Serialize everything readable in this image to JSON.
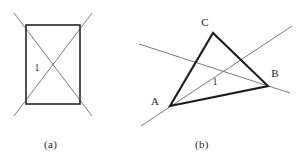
{
  "page": {
    "width": 304,
    "height": 168,
    "background": "#ffffff",
    "ink_color": "#2b2b2b",
    "thin_stroke_color": "#5a5a5a",
    "thick_stroke_color": "#1c1c1c"
  },
  "figures": [
    {
      "id": "figure-a",
      "caption": "(a)",
      "description": "rectangle with two diagonals extended beyond the corners",
      "angle_label": "1",
      "shape": {
        "type": "rectangle",
        "left": 26,
        "top": 25,
        "right": 80,
        "bottom": 104
      },
      "diagonals": [
        {
          "x1": 14,
          "y1": 13,
          "x2": 92,
          "y2": 116
        },
        {
          "x1": 92,
          "y1": 13,
          "x2": 14,
          "y2": 116
        }
      ],
      "angle_label_pos": {
        "x": 37,
        "y": 71
      }
    },
    {
      "id": "figure-b",
      "caption": "(b)",
      "description": "triangle ABC with two transversal lines crossing inside",
      "angle_label": "1",
      "vertices": [
        {
          "name": "A",
          "x": 170,
          "y": 106,
          "label_x": 155,
          "label_y": 105
        },
        {
          "name": "B",
          "x": 268,
          "y": 86,
          "label_x": 273,
          "label_y": 76
        },
        {
          "name": "C",
          "x": 213,
          "y": 33,
          "label_x": 204,
          "label_y": 25
        }
      ],
      "lines": [
        {
          "name": "line-through-A-rising",
          "x1": 141,
          "y1": 126,
          "x2": 292,
          "y2": 26
        },
        {
          "name": "line-through-B-falling",
          "x1": 139,
          "y1": 44,
          "x2": 290,
          "y2": 93
        }
      ],
      "angle_label_pos": {
        "x": 215,
        "y": 84
      }
    }
  ]
}
